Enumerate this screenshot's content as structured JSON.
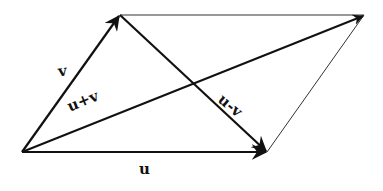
{
  "diagram": {
    "type": "vector-parallelogram",
    "colors": {
      "ink": "#111111",
      "background": "#ffffff"
    },
    "points": {
      "origin": [
        22,
        152
      ],
      "v_tip": [
        120,
        15
      ],
      "u_tip": [
        267,
        152
      ],
      "sum_tip": [
        364,
        15
      ]
    },
    "vectors": [
      {
        "id": "v",
        "label": "v",
        "from": "origin",
        "to": "v_tip",
        "arrow": true,
        "weight": "thick"
      },
      {
        "id": "u",
        "label": "u",
        "from": "origin",
        "to": "u_tip",
        "arrow": true,
        "weight": "thick"
      },
      {
        "id": "u_plus_v",
        "label": "u+v",
        "from": "origin",
        "to": "sum_tip",
        "arrow": true,
        "weight": "thick"
      },
      {
        "id": "u_minus_v",
        "label": "u-v",
        "from": "v_tip",
        "to": "u_tip",
        "arrow": true,
        "weight": "thick"
      }
    ],
    "edges": [
      {
        "id": "top-edge",
        "from": "v_tip",
        "to": "sum_tip",
        "weight": "thin"
      },
      {
        "id": "right-edge",
        "from": "u_tip",
        "to": "sum_tip",
        "weight": "thin"
      }
    ],
    "labels": {
      "v": "v",
      "u": "u",
      "u_plus_v": "u+v",
      "u_minus_v": "u-v"
    }
  }
}
